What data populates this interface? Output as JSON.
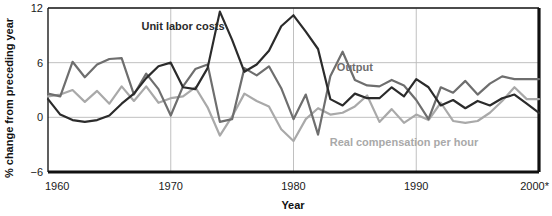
{
  "chart_data": {
    "type": "line",
    "title": "",
    "xlabel": "Year",
    "ylabel": "% change from preceding year",
    "xlim": [
      1960,
      2000
    ],
    "ylim": [
      -6,
      12
    ],
    "yticks": [
      -6,
      0,
      6,
      12
    ],
    "ytick_labels": [
      "−6",
      "0",
      "6",
      "12"
    ],
    "xticks": [
      1960,
      1970,
      1980,
      1990,
      2000
    ],
    "xtick_labels": [
      "1960",
      "1970",
      "1980",
      "1990",
      "2000*"
    ],
    "grid": true,
    "grid_axes": "both",
    "legend": "inline-annotations",
    "x": [
      1960,
      1961,
      1962,
      1963,
      1964,
      1965,
      1966,
      1967,
      1968,
      1969,
      1970,
      1971,
      1972,
      1973,
      1974,
      1975,
      1976,
      1977,
      1978,
      1979,
      1980,
      1981,
      1982,
      1983,
      1984,
      1985,
      1986,
      1987,
      1988,
      1989,
      1990,
      1991,
      1992,
      1993,
      1994,
      1995,
      1996,
      1997,
      1998,
      1999,
      2000
    ],
    "series": [
      {
        "name": "Unit labor costs",
        "color": "#2b2b2b",
        "label_x": 1971,
        "label_y": 9.6,
        "values": [
          2.0,
          0.3,
          -0.3,
          -0.5,
          -0.3,
          0.2,
          1.5,
          2.6,
          4.3,
          5.6,
          6.0,
          3.3,
          3.1,
          5.4,
          11.6,
          8.5,
          5.0,
          5.8,
          7.3,
          10.0,
          11.2,
          9.4,
          7.5,
          2.0,
          1.3,
          2.6,
          2.1,
          2.1,
          3.3,
          2.3,
          4.2,
          3.3,
          1.3,
          1.9,
          1.0,
          1.8,
          1.3,
          2.1,
          2.5,
          1.5,
          0.5
        ]
      },
      {
        "name": "Output",
        "color": "#6e6e6e",
        "label_x": 1985,
        "label_y": 5.1,
        "values": [
          2.6,
          2.3,
          6.1,
          4.4,
          5.8,
          6.4,
          6.5,
          2.5,
          4.8,
          3.1,
          0.2,
          3.4,
          5.3,
          5.8,
          -0.5,
          -0.2,
          5.4,
          4.6,
          5.6,
          3.2,
          -0.2,
          2.5,
          -1.9,
          4.5,
          7.2,
          4.1,
          3.5,
          3.4,
          4.1,
          3.5,
          1.9,
          -0.2,
          3.3,
          2.7,
          4.0,
          2.5,
          3.7,
          4.5,
          4.2,
          4.2,
          4.2
        ]
      },
      {
        "name": "Real compensation per hour",
        "color": "#a9a9a9",
        "label_x": 1989,
        "label_y": -3.2,
        "values": [
          2.3,
          2.5,
          3.0,
          1.7,
          2.9,
          1.5,
          3.4,
          1.8,
          3.4,
          1.6,
          2.1,
          2.3,
          3.3,
          1.1,
          -2.0,
          0.1,
          2.6,
          1.8,
          1.2,
          -1.3,
          -2.6,
          -0.2,
          1.0,
          0.3,
          0.5,
          1.2,
          2.4,
          -0.5,
          0.9,
          -0.6,
          0.3,
          -0.3,
          1.6,
          -0.4,
          -0.6,
          -0.4,
          0.5,
          1.8,
          3.3,
          2.0,
          2.0
        ]
      }
    ]
  },
  "footnote": "*",
  "axis": {
    "y_label": "% change from preceding year",
    "x_label": "Year"
  }
}
